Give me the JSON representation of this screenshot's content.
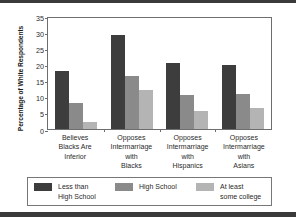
{
  "chart_data": {
    "type": "bar",
    "title": "",
    "subtitle": "",
    "xlabel": "",
    "ylabel": "Percentage of White Respondents",
    "ylim": [
      0,
      35
    ],
    "yticks": [
      0,
      5,
      10,
      15,
      20,
      25,
      30,
      35
    ],
    "ytick_labels": [
      "0",
      "5",
      "10",
      "15",
      "20",
      "25",
      "30",
      "35"
    ],
    "grid": false,
    "legend_position": "bottom",
    "categories": [
      "Believes\nBlacks Are\nInferior",
      "Opposes\nIntermarriage\nwith\nBlacks",
      "Opposes\nIntermarriage\nwith\nHispanics",
      "Opposes\nIntermarriage\nwith\nAsians"
    ],
    "category_lines": [
      [
        "Believes",
        "Blacks Are",
        "Inferior"
      ],
      [
        "Opposes",
        "Intermarriage",
        "with",
        "Blacks"
      ],
      [
        "Opposes",
        "Intermarriage",
        "with",
        "Hispanics"
      ],
      [
        "Opposes",
        "Intermarriage",
        "with",
        "Asians"
      ]
    ],
    "series": [
      {
        "name": "Less than High School",
        "legend_lines": [
          "Less than",
          "High School"
        ],
        "color": "#3d3d3d",
        "values": [
          18.0,
          29.0,
          20.5,
          19.7
        ]
      },
      {
        "name": "High School",
        "legend_lines": [
          "High School"
        ],
        "color": "#8a8a8a",
        "values": [
          8.0,
          16.5,
          10.5,
          11.0
        ]
      },
      {
        "name": "At least some college",
        "legend_lines": [
          "At least",
          "some college"
        ],
        "color": "#b4b4b4",
        "values": [
          2.3,
          12.0,
          5.5,
          6.6
        ]
      }
    ]
  },
  "colors": {
    "series_dark": "#3d3d3d",
    "series_medium": "#8a8a8a",
    "series_light": "#b4b4b4",
    "axis": "#6e6e6e",
    "rule": "#3a3a3a",
    "background": "#ffffff"
  }
}
